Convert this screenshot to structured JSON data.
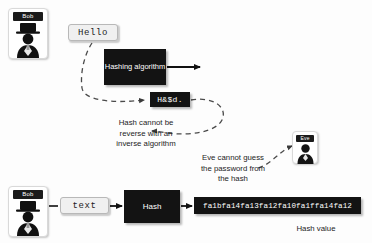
{
  "diagram": {
    "background_color": "#fdfdfd",
    "dark_color": "#131313",
    "light_box_color": "#f0f0f0"
  },
  "people": {
    "bob_top": {
      "name": "Bob",
      "avatar": "person-with-tophat-icon"
    },
    "bob_bottom": {
      "name": "Bob",
      "avatar": "person-with-tophat-icon"
    },
    "eve": {
      "name": "Eve",
      "avatar": "person-icon"
    }
  },
  "top_flow": {
    "input_label": "Hello",
    "algorithm_label": "Hashing\nalgorithm",
    "output_label": "H&$d.",
    "note": "Hash cannot be\nreverse with an\ninverse algorithm"
  },
  "eve_note": "Eve cannot guess\nthe password from\nthe hash",
  "bottom_flow": {
    "input_label": "text",
    "hash_label": "Hash",
    "hash_value": "fa1bfa14fa13fa12fa10fa1ffa14fa12",
    "hash_value_caption": "Hash value"
  }
}
